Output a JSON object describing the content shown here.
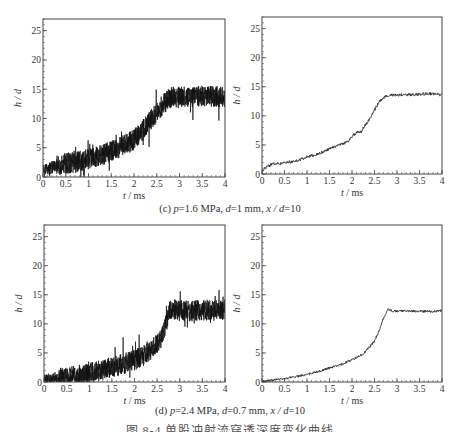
{
  "figure": {
    "caption_c": "(c) p=1.6 MPa, d=1 mm, x/d=10",
    "caption_c_parts": {
      "label": "(c) ",
      "p": "p",
      "p_val": "=1.6 MPa, ",
      "d": "d",
      "d_val": "=1 mm, ",
      "xd": "x / d",
      "xd_val": "=10"
    },
    "caption_d": "(d) p=2.4 MPa, d=0.7 mm, x/d=10",
    "caption_d_parts": {
      "label": "(d) ",
      "p": "p",
      "p_val": "=2.4 MPa, ",
      "d": "d",
      "d_val": "=0.7 mm, ",
      "xd": "x / d",
      "xd_val": "=10"
    },
    "figure_title": "图 8-4 单股冲射流穿透深度变化曲线"
  },
  "chart_data": [
    {
      "id": "c-raw",
      "type": "line",
      "title": "",
      "style": "noisy raw signal",
      "xlabel": "t / ms",
      "ylabel": "h / d",
      "xlim": [
        0,
        4
      ],
      "ylim": [
        0,
        27
      ],
      "xticks": [
        0,
        0.5,
        1,
        1.5,
        2,
        2.5,
        3,
        3.5,
        4
      ],
      "xtick_labels": [
        "0",
        "0.5",
        "1",
        "1.5",
        "2",
        "2.5",
        "3",
        "3.5",
        "4"
      ],
      "yticks": [
        0,
        5,
        10,
        15,
        20,
        25
      ],
      "ytick_labels": [
        "0",
        "5",
        "10",
        "15",
        "20",
        "25"
      ],
      "grid": false,
      "noise_amplitude": 1.8,
      "x": [
        0,
        0.25,
        0.5,
        0.75,
        1.0,
        1.25,
        1.5,
        1.75,
        2.0,
        2.25,
        2.5,
        2.65,
        2.8,
        3.0,
        3.25,
        3.5,
        3.75,
        4.0
      ],
      "y": [
        1.0,
        1.8,
        2.2,
        2.6,
        3.0,
        3.6,
        4.4,
        5.3,
        6.4,
        8.5,
        11.0,
        12.5,
        13.6,
        13.8,
        13.7,
        13.8,
        13.8,
        13.6
      ]
    },
    {
      "id": "c-filtered",
      "type": "line",
      "title": "",
      "style": "filtered",
      "xlabel": "t / ms",
      "ylabel": "h / d",
      "xlim": [
        0,
        4
      ],
      "ylim": [
        0,
        27
      ],
      "xticks": [
        0,
        0.5,
        1,
        1.5,
        2,
        2.5,
        3,
        3.5,
        4
      ],
      "xtick_labels": [
        "0",
        "0.5",
        "1",
        "1.5",
        "2",
        "2.5",
        "3",
        "3.5",
        "4"
      ],
      "yticks": [
        0,
        5,
        10,
        15,
        20,
        25
      ],
      "ytick_labels": [
        "0",
        "5",
        "10",
        "15",
        "20",
        "25"
      ],
      "grid": false,
      "noise_amplitude": 0.25,
      "x": [
        0,
        0.1,
        0.25,
        0.4,
        0.5,
        0.75,
        1.0,
        1.25,
        1.5,
        1.75,
        1.9,
        2.0,
        2.1,
        2.2,
        2.3,
        2.4,
        2.5,
        2.6,
        2.75,
        2.9,
        3.0,
        3.25,
        3.5,
        3.75,
        4.0
      ],
      "y": [
        0.6,
        1.2,
        1.8,
        1.8,
        2.0,
        2.2,
        2.9,
        3.5,
        4.3,
        5.1,
        5.5,
        6.5,
        7.1,
        7.2,
        8.5,
        9.5,
        11.0,
        12.4,
        13.4,
        13.6,
        13.6,
        13.6,
        13.7,
        13.8,
        13.6
      ]
    },
    {
      "id": "d-raw",
      "type": "line",
      "title": "",
      "style": "noisy raw signal",
      "xlabel": "t / ms",
      "ylabel": "h / d",
      "xlim": [
        0,
        4
      ],
      "ylim": [
        0,
        27
      ],
      "xticks": [
        0,
        0.5,
        1,
        1.5,
        2,
        2.5,
        3,
        3.5,
        4
      ],
      "xtick_labels": [
        "0",
        "0.5",
        "1",
        "1.5",
        "2",
        "2.5",
        "3",
        "3.5",
        "4"
      ],
      "yticks": [
        0,
        5,
        10,
        15,
        20,
        25
      ],
      "ytick_labels": [
        "0",
        "5",
        "10",
        "15",
        "20",
        "25"
      ],
      "grid": false,
      "noise_amplitude": 1.8,
      "x": [
        0,
        0.25,
        0.5,
        0.75,
        1.0,
        1.25,
        1.5,
        1.75,
        2.0,
        2.25,
        2.5,
        2.65,
        2.78,
        2.85,
        3.0,
        3.25,
        3.5,
        3.75,
        4.0
      ],
      "y": [
        0.3,
        0.5,
        0.8,
        1.1,
        1.5,
        2.0,
        2.6,
        3.1,
        3.8,
        4.8,
        6.6,
        8.5,
        12.4,
        12.6,
        12.3,
        12.2,
        12.4,
        12.3,
        12.4
      ]
    },
    {
      "id": "d-filtered",
      "type": "line",
      "title": "",
      "style": "filtered",
      "xlabel": "t / ms",
      "ylabel": "h / d",
      "xlim": [
        0,
        4
      ],
      "ylim": [
        0,
        27
      ],
      "xticks": [
        0,
        0.5,
        1,
        1.5,
        2,
        2.5,
        3,
        3.5,
        4
      ],
      "xtick_labels": [
        "0",
        "0.5",
        "1",
        "1.5",
        "2",
        "2.5",
        "3",
        "3.5",
        "4"
      ],
      "yticks": [
        0,
        5,
        10,
        15,
        20,
        25
      ],
      "ytick_labels": [
        "0",
        "5",
        "10",
        "15",
        "20",
        "25"
      ],
      "grid": false,
      "noise_amplitude": 0.2,
      "x": [
        0,
        0.25,
        0.5,
        0.75,
        1.0,
        1.25,
        1.5,
        1.75,
        2.0,
        2.25,
        2.5,
        2.6,
        2.7,
        2.8,
        2.9,
        3.0,
        3.25,
        3.5,
        3.75,
        4.0
      ],
      "y": [
        0.1,
        0.3,
        0.6,
        0.9,
        1.3,
        1.8,
        2.4,
        3.0,
        3.8,
        4.8,
        7.0,
        8.8,
        11.0,
        12.5,
        12.2,
        12.2,
        12.2,
        12.2,
        12.1,
        12.3
      ]
    }
  ]
}
